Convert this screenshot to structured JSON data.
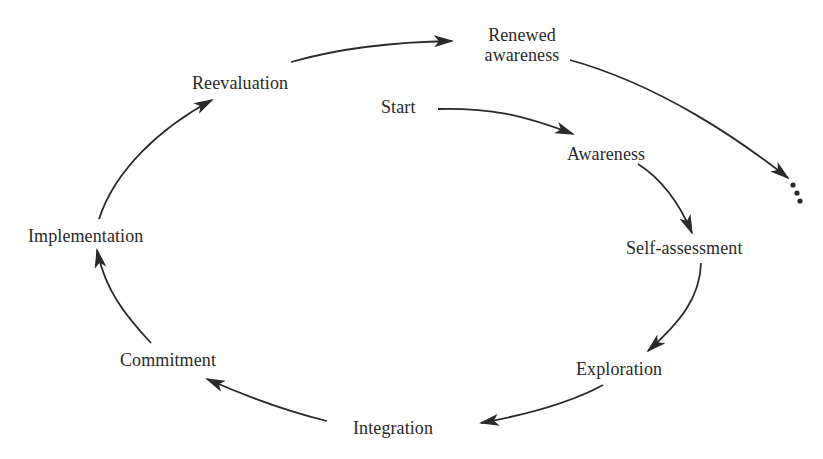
{
  "diagram": {
    "type": "cyclic-process",
    "nodes": {
      "start": "Start",
      "awareness": "Awareness",
      "self_assessment": "Self-assessment",
      "exploration": "Exploration",
      "integration": "Integration",
      "commitment": "Commitment",
      "implementation": "Implementation",
      "reevaluation": "Reevaluation",
      "renewed_awareness_line1": "Renewed",
      "renewed_awareness_line2": "awareness",
      "continuation": "..."
    },
    "edges": [
      {
        "from": "Start",
        "to": "Awareness"
      },
      {
        "from": "Awareness",
        "to": "Self-assessment"
      },
      {
        "from": "Self-assessment",
        "to": "Exploration"
      },
      {
        "from": "Exploration",
        "to": "Integration"
      },
      {
        "from": "Integration",
        "to": "Commitment"
      },
      {
        "from": "Commitment",
        "to": "Implementation"
      },
      {
        "from": "Implementation",
        "to": "Reevaluation"
      },
      {
        "from": "Reevaluation",
        "to": "Renewed awareness"
      },
      {
        "from": "Renewed awareness",
        "to": "..."
      }
    ],
    "colors": {
      "ink": "#2a2a2a",
      "background": "#ffffff"
    }
  }
}
